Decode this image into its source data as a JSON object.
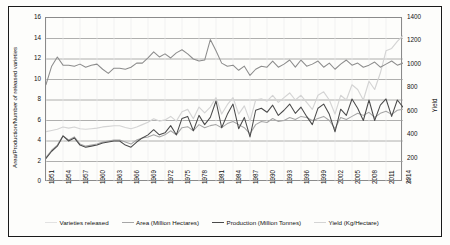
{
  "chart_data": {
    "type": "line",
    "title": "",
    "subtitle": "",
    "xlabel": "",
    "ylabel": "Area/Production/Number of released varieties",
    "ylabel_secondary": "Yield",
    "ylim": [
      0,
      16
    ],
    "ylim_secondary": [
      0,
      1400
    ],
    "yticks": [
      0,
      2,
      4,
      6,
      8,
      10,
      12,
      14,
      16
    ],
    "yticks_secondary": [
      0,
      200,
      400,
      600,
      800,
      1000,
      1200,
      1400
    ],
    "grid": true,
    "grid_axis": "y",
    "legend_position": "bottom",
    "xlim": [
      1951,
      2014
    ],
    "xticks": [
      1951,
      1954,
      1957,
      1960,
      1963,
      1966,
      1969,
      1972,
      1975,
      1978,
      1981,
      1984,
      1987,
      1990,
      1993,
      1996,
      1999,
      2002,
      2005,
      2008,
      2011,
      2014
    ],
    "x": [
      1951,
      1952,
      1953,
      1954,
      1955,
      1956,
      1957,
      1958,
      1959,
      1960,
      1961,
      1962,
      1963,
      1964,
      1965,
      1966,
      1967,
      1968,
      1969,
      1970,
      1971,
      1972,
      1973,
      1974,
      1975,
      1976,
      1977,
      1978,
      1979,
      1980,
      1981,
      1982,
      1983,
      1984,
      1985,
      1986,
      1987,
      1988,
      1989,
      1990,
      1991,
      1992,
      1993,
      1994,
      1995,
      1996,
      1997,
      1998,
      1999,
      2000,
      2001,
      2002,
      2003,
      2004,
      2005,
      2006,
      2007,
      2008,
      2009,
      2010,
      2011,
      2012,
      2013,
      2014
    ],
    "series": [
      {
        "name": "Varieties released",
        "axis": "left",
        "color": "#8c8c8c",
        "values": [
          9.5,
          11.3,
          12.2,
          11.4,
          11.4,
          11.3,
          11.5,
          11.2,
          11.4,
          11.5,
          11.0,
          10.6,
          11.1,
          11.1,
          11.0,
          11.2,
          11.6,
          11.6,
          12.1,
          12.7,
          12.2,
          12.5,
          12.1,
          12.6,
          12.9,
          12.5,
          12.0,
          11.8,
          11.9,
          13.9,
          12.8,
          11.6,
          11.3,
          11.4,
          10.9,
          11.3,
          10.4,
          11.0,
          11.3,
          11.2,
          11.8,
          11.2,
          11.5,
          11.9,
          11.2,
          11.9,
          11.3,
          11.5,
          11.8,
          11.2,
          11.6,
          11.0,
          11.5,
          11.9,
          11.4,
          11.6,
          11.2,
          11.4,
          11.7,
          11.2,
          11.5,
          11.8,
          11.4,
          11.6
        ]
      },
      {
        "name": "Area (Million Hectares)",
        "axis": "left",
        "color": "#a6a6a6",
        "values": [
          2.4,
          3.1,
          3.6,
          4.5,
          4.1,
          4.4,
          3.7,
          3.5,
          3.6,
          3.7,
          3.9,
          4.0,
          4.1,
          4.1,
          3.9,
          3.7,
          4.1,
          4.3,
          4.4,
          4.6,
          4.4,
          4.6,
          5.0,
          4.6,
          5.3,
          5.4,
          5.0,
          5.6,
          5.3,
          5.5,
          5.6,
          5.3,
          5.7,
          5.9,
          5.6,
          5.3,
          4.7,
          5.6,
          5.9,
          5.8,
          6.2,
          5.9,
          6.0,
          6.3,
          6.1,
          6.4,
          6.3,
          6.0,
          6.2,
          6.4,
          6.0,
          5.2,
          6.3,
          6.1,
          6.4,
          6.7,
          6.5,
          6.8,
          6.3,
          6.7,
          6.9,
          6.6,
          7.0,
          7.1
        ]
      },
      {
        "name": "Production (Million Tonnes)",
        "axis": "left",
        "color": "#4a4a4a",
        "values": [
          2.3,
          3.0,
          3.5,
          4.5,
          4.0,
          4.3,
          3.6,
          3.4,
          3.5,
          3.6,
          3.8,
          3.9,
          4.0,
          4.0,
          3.6,
          3.4,
          3.9,
          4.3,
          4.6,
          5.1,
          4.6,
          4.8,
          5.5,
          4.6,
          6.2,
          6.4,
          5.0,
          6.5,
          5.6,
          6.3,
          7.9,
          5.3,
          6.6,
          7.6,
          5.2,
          6.3,
          4.4,
          7.0,
          7.2,
          6.8,
          7.5,
          6.5,
          7.0,
          7.6,
          6.7,
          7.3,
          6.4,
          5.6,
          7.2,
          7.6,
          6.6,
          4.9,
          7.1,
          6.5,
          8.1,
          7.2,
          6.0,
          8.0,
          6.0,
          7.5,
          8.1,
          6.4,
          8.0,
          7.3
        ]
      },
      {
        "name": "Yield (Kg/Hectare)",
        "axis": "right",
        "color": "#d4d4d4",
        "values": [
          430,
          440,
          450,
          470,
          460,
          470,
          455,
          450,
          455,
          460,
          470,
          475,
          480,
          480,
          465,
          455,
          470,
          490,
          510,
          540,
          520,
          530,
          560,
          520,
          600,
          620,
          540,
          640,
          590,
          640,
          720,
          580,
          660,
          720,
          580,
          650,
          520,
          700,
          710,
          690,
          740,
          680,
          720,
          760,
          700,
          740,
          680,
          620,
          740,
          770,
          700,
          580,
          740,
          700,
          830,
          790,
          700,
          860,
          790,
          930,
          1120,
          1140,
          1200,
          1250
        ]
      }
    ]
  },
  "legend": {
    "items": [
      {
        "label": "Varieties released",
        "color": "#e2e2e2"
      },
      {
        "label": "Area (Million Hectares)",
        "color": "#a6a6a6"
      },
      {
        "label": "Production (Million Tonnes)",
        "color": "#4a4a4a"
      },
      {
        "label": "Yield  (Kg/Hectare)",
        "color": "#d4d4d4"
      }
    ]
  }
}
